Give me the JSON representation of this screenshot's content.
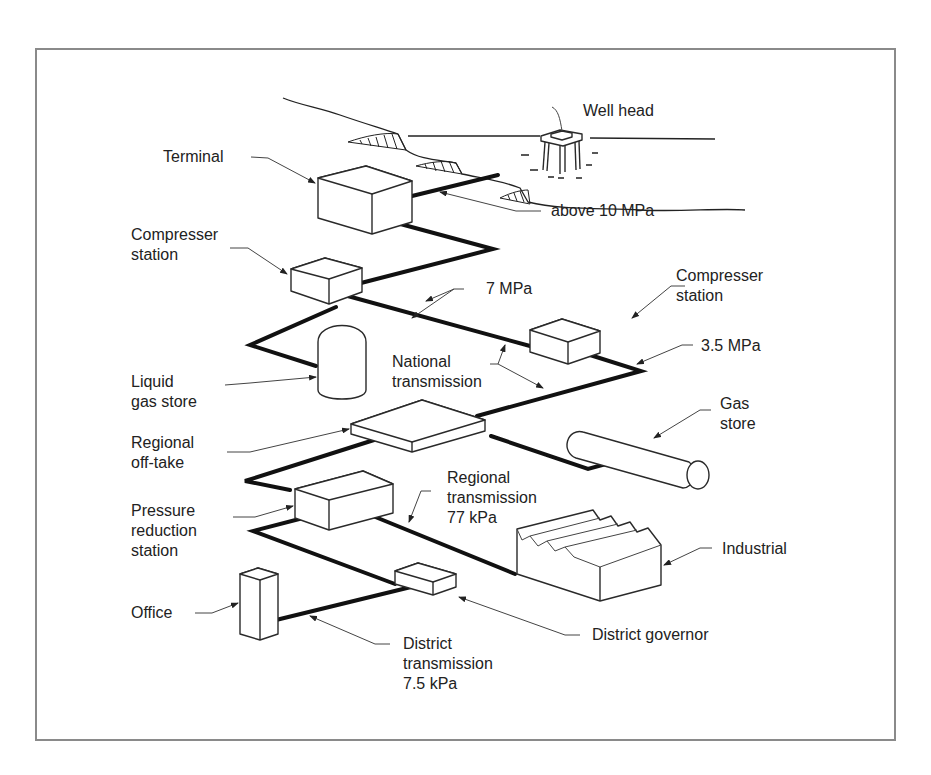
{
  "diagram": {
    "labels": {
      "well_head": "Well head",
      "terminal": "Terminal",
      "above_10mpa": "above 10 MPa",
      "compressor_station_1": "Compresser\nstation",
      "seven_mpa": "7 MPa",
      "compressor_station_2": "Compresser\nstation",
      "three_five_mpa": "3.5 MPa",
      "liquid_gas_store": "Liquid\ngas store",
      "national_transmission": "National\ntransmission",
      "gas_store": "Gas\nstore",
      "regional_offtake": "Regional\noff-take",
      "regional_transmission": "Regional\ntransmission\n77 kPa",
      "pressure_reduction_station": "Pressure\nreduction\nstation",
      "industrial": "Industrial",
      "office": "Office",
      "district_governor": "District governor",
      "district_transmission": "District\ntransmission\n7.5 kPa"
    },
    "colors": {
      "line": "#111111",
      "frame": "#8a8a8a",
      "background": "#ffffff"
    }
  }
}
